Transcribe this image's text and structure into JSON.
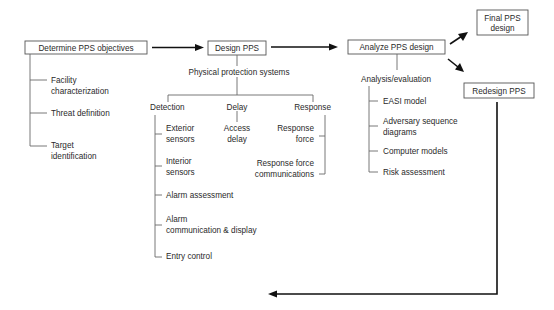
{
  "diagram": {
    "nodes": {
      "determine": "Determine PPS objectives",
      "design": "Design PPS",
      "analyze": "Analyze PPS design",
      "final_line1": "Final PPS",
      "final_line2": "design",
      "redesign": "Redesign PPS"
    },
    "objectives": {
      "items": [
        {
          "line1": "Facility",
          "line2": "characterization"
        },
        {
          "line1": "Threat definition",
          "line2": ""
        },
        {
          "line1": "Target",
          "line2": "identification"
        }
      ]
    },
    "design": {
      "subtitle": "Physical protection systems",
      "detection": {
        "label": "Detection",
        "items": [
          {
            "line1": "Exterior",
            "line2": "sensors"
          },
          {
            "line1": "Interior",
            "line2": "sensors"
          },
          {
            "line1": "Alarm assessment",
            "line2": ""
          },
          {
            "line1": "Alarm",
            "line2": "communication & display"
          },
          {
            "line1": "Entry control",
            "line2": ""
          }
        ]
      },
      "delay": {
        "label": "Delay",
        "items": [
          {
            "line1": "Access",
            "line2": "delay"
          }
        ]
      },
      "response": {
        "label": "Response",
        "items": [
          {
            "line1": "Response",
            "line2": "force"
          },
          {
            "line1": "Response force",
            "line2": "communications"
          }
        ]
      }
    },
    "analysis": {
      "subtitle": "Analysis/evaluation",
      "items": [
        {
          "line1": "EASI model",
          "line2": ""
        },
        {
          "line1": "Adversary sequence",
          "line2": "diagrams"
        },
        {
          "line1": "Computer models",
          "line2": ""
        },
        {
          "line1": "Risk assessment",
          "line2": ""
        }
      ]
    }
  }
}
